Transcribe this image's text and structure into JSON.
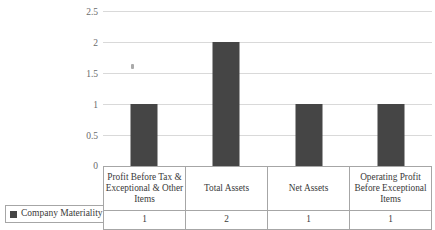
{
  "chart_data": {
    "type": "bar",
    "title": "",
    "xlabel": "",
    "ylabel": "",
    "ylim": [
      0,
      2.5
    ],
    "grid": true,
    "legend_position": "bottom-left",
    "categories": [
      "Profit Before Tax & Exceptional & Other Items",
      "Total Assets",
      "Net Assets",
      "Operating Profit Before Exceptional Items"
    ],
    "series": [
      {
        "name": "Company Materiality",
        "values": [
          1,
          2,
          1,
          1
        ],
        "color": "#454545"
      }
    ],
    "yticks": [
      "0",
      "0.5",
      "1",
      "1.5",
      "2",
      "2.5"
    ],
    "ytick_values": [
      0,
      0.5,
      1,
      1.5,
      2,
      2.5
    ]
  },
  "table": {
    "category_row": [
      "Profit Before Tax & Exceptional & Other Items",
      "Total Assets",
      "Net Assets",
      "Operating Profit Before Exceptional Items"
    ],
    "value_row": [
      "1",
      "2",
      "1",
      "1"
    ]
  },
  "legend": {
    "label": "Company Materiality",
    "swatch_color": "#454545"
  },
  "colors": {
    "bar": "#454545",
    "gridline": "#d9d9d9",
    "table_border": "#a6a6a6",
    "axis_text": "#6b6b6b",
    "background": "#ffffff"
  }
}
